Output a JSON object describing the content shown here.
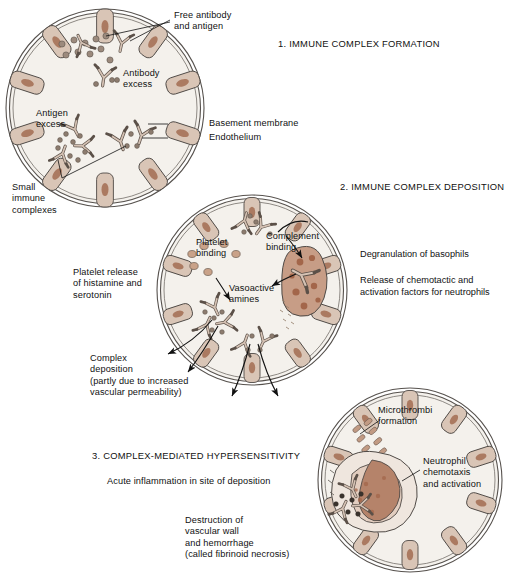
{
  "figure": {
    "sections": [
      {
        "id": "s1",
        "title": "1. IMMUNE COMPLEX FORMATION"
      },
      {
        "id": "s2",
        "title": "2. IMMUNE COMPLEX DEPOSITION"
      },
      {
        "id": "s3",
        "title": "3. COMPLEX-MEDIATED HYPERSENSITIVITY"
      }
    ]
  },
  "panel1": {
    "label_free": "Free antibody\nand antigen",
    "label_antibody_excess": "Antibody\nexcess",
    "label_antigen_excess": "Antigen\nexcess",
    "label_basement_membrane": "Basement membrane",
    "label_endothelium": "Endothelium",
    "label_small_complexes": "Small\nimmune\ncomplexes"
  },
  "panel2": {
    "label_platelet_binding": "Platelet\nbinding",
    "label_complement_binding": "Complement\nbinding",
    "label_vasoactive_amines": "Vasoactive\namines",
    "label_platelet_release": "Platelet release\nof histamine and\nserotonin",
    "label_complex_deposition": "Complex\ndeposition\n(partly due to increased\nvascular permeability)",
    "note_degranulation": "Degranulation of basophils",
    "note_chemotactic": "Release of chemotactic and\nactivation factors for neutrophils"
  },
  "panel3": {
    "label_microthrombi": "Microthrombi\nformation",
    "label_neutrophil": "Neutrophil\nchemotaxis\nand activation",
    "note_acute_inflammation": "Acute inflammation in site of deposition",
    "note_destruction": "Destruction of\nvascular wall\nand hemorrhage\n(called fibrinoid necrosis)"
  },
  "colors": {
    "page_background": "#ffffff",
    "lumen": "#f4f1ec",
    "endothelial_cell": "#d8c3b4",
    "cell_nucleus": "#a9775f",
    "outline": "#4a4a4a",
    "basophil_body": "#c79d86",
    "basophil_granule": "#a3664a",
    "neutrophil_fill": "#e2cdbf",
    "neutrophil_lobe": "#b5836a",
    "platelet": "#c9a08a",
    "antibody": "#cbb5a6",
    "text": "#111111"
  }
}
